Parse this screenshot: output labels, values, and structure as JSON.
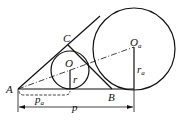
{
  "diagram": {
    "labels": {
      "A": "A",
      "B": "B",
      "C": "C",
      "O": "O",
      "Oa": "O",
      "Oa_sub": "a",
      "r": "r",
      "ra": "r",
      "ra_sub": "a",
      "pa": "p",
      "pa_sub": "a",
      "p": "p"
    },
    "colors": {
      "stroke": "#111111",
      "background": "#ffffff"
    }
  }
}
